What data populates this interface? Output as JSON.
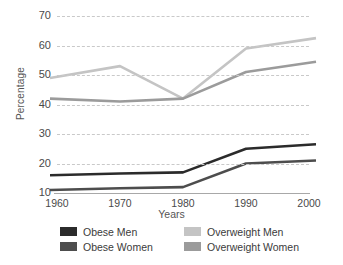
{
  "chart_data": {
    "type": "line",
    "title": "",
    "xlabel": "Years",
    "ylabel": "Percentage",
    "categories": [
      "1960",
      "1970",
      "1980",
      "1990",
      "2000"
    ],
    "x": [
      1960,
      1970,
      1980,
      1990,
      2000
    ],
    "xlim": [
      1960,
      2000
    ],
    "ylim": [
      10,
      70
    ],
    "yticks": [
      10,
      20,
      30,
      40,
      50,
      60,
      70
    ],
    "ytick_labels": [
      "10",
      "20",
      "30",
      "40",
      "50",
      "60",
      "70"
    ],
    "grid": "horizontal-dashed",
    "legend_position": "bottom",
    "series": [
      {
        "name": "Obese Men",
        "color": "#2b2b2b",
        "values": [
          16,
          16.6,
          17,
          25,
          26.5
        ]
      },
      {
        "name": "Obese Women",
        "color": "#4d4d4d",
        "values": [
          11,
          11.6,
          12,
          20,
          21
        ]
      },
      {
        "name": "Overweight Men",
        "color": "#c4c4c4",
        "values": [
          49,
          53,
          42,
          59,
          62.5
        ]
      },
      {
        "name": "Overweight Women",
        "color": "#9b9b9b",
        "values": [
          42,
          41,
          42,
          51,
          54.5
        ]
      }
    ]
  },
  "axis": {
    "y_title": "Percentage",
    "x_title": "Years"
  },
  "legend": {
    "items": [
      {
        "label": "Obese Men",
        "color": "#2b2b2b"
      },
      {
        "label": "Overweight Men",
        "color": "#c4c4c4"
      },
      {
        "label": "Obese Women",
        "color": "#4d4d4d"
      },
      {
        "label": "Overweight Women",
        "color": "#9b9b9b"
      }
    ]
  }
}
